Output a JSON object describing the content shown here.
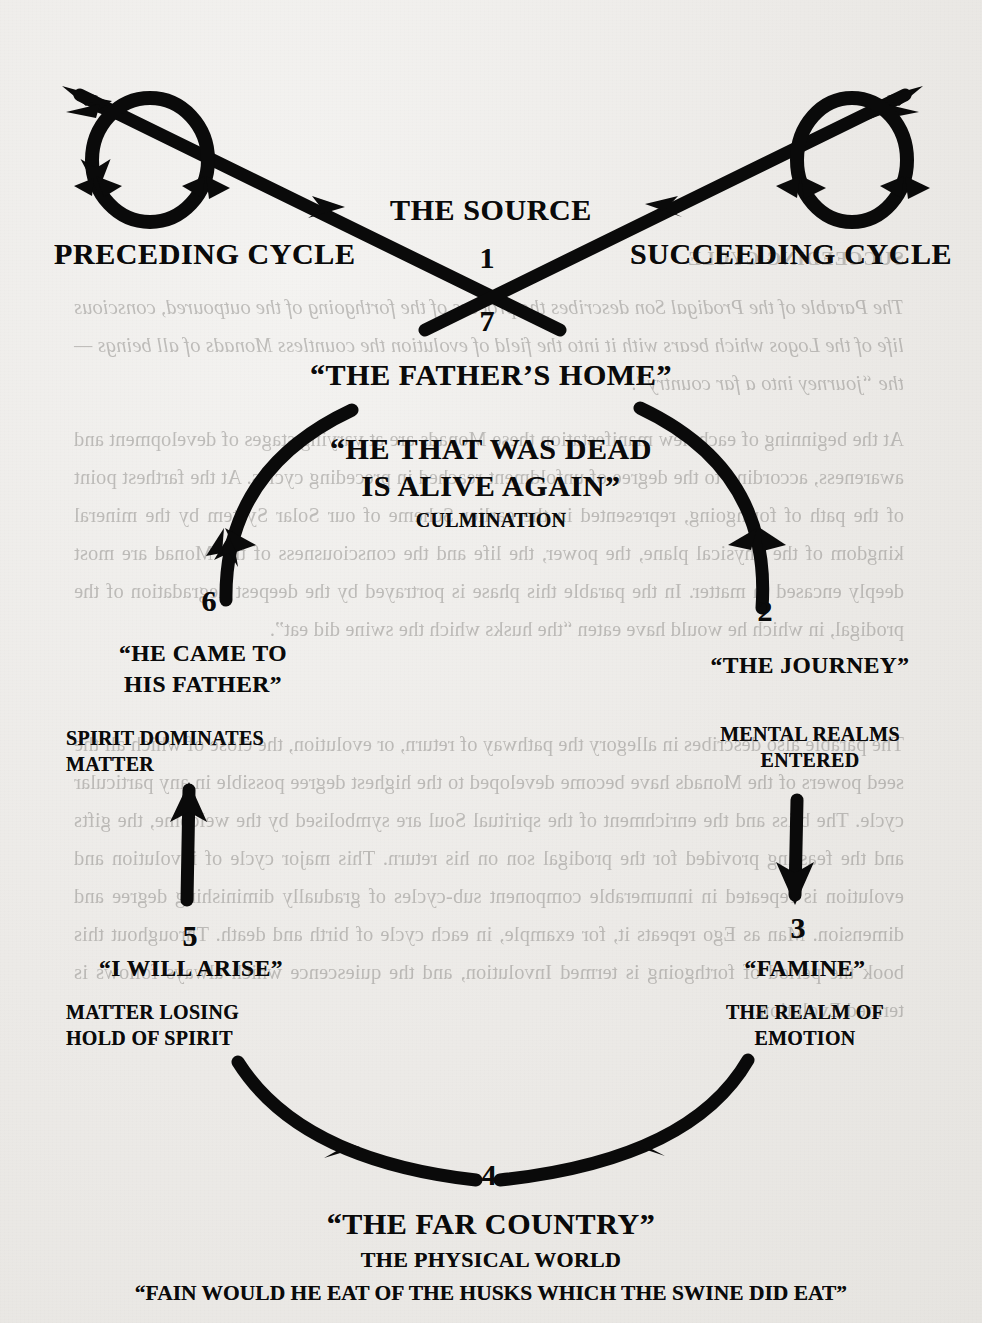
{
  "figure": {
    "type": "cycle-diagram",
    "title_center": "THE SOURCE",
    "paper_color": "#edecea",
    "ink_color": "#0a0a0a",
    "ghost_ink_color": "#8f8d8a"
  },
  "top": {
    "left_cycle_label": "PRECEDING CYCLE",
    "right_cycle_label": "SUCCEEDING CYCLE",
    "source_label": "THE SOURCE",
    "number_above_crossing": "1",
    "number_below_crossing": "7"
  },
  "stages": [
    {
      "number": "1",
      "name": "stage-1-the-source",
      "title": "THE SOURCE",
      "subtitle": "",
      "position": "top-center"
    },
    {
      "number": "7",
      "name": "stage-7-the-fathers-home",
      "title": "“THE FATHER’S HOME”",
      "subtitle": "",
      "position": "top-center-below"
    },
    {
      "number": "6",
      "name": "stage-6-he-came-to-his-father",
      "title_line_1": "“HE CAME TO",
      "title_line_2": "HIS FATHER”",
      "subtitle_line_1": "SPIRIT DOMINATES",
      "subtitle_line_2": "MATTER",
      "position": "left-upper"
    },
    {
      "number": "5",
      "name": "stage-5-i-will-arise",
      "title": "“I WILL ARISE”",
      "subtitle_line_1": "MATTER LOSING",
      "subtitle_line_2": "HOLD OF SPIRIT",
      "position": "left-lower"
    },
    {
      "number": "4",
      "name": "stage-4-the-far-country",
      "title": "“THE FAR COUNTRY”",
      "subtitle": "THE PHYSICAL WORLD",
      "quote": "“FAIN WOULD HE EAT OF THE HUSKS WHICH THE SWINE DID EAT”",
      "position": "bottom-center"
    },
    {
      "number": "3",
      "name": "stage-3-famine",
      "title": "“FAMINE”",
      "subtitle_line_1": "THE REALM OF",
      "subtitle_line_2": "EMOTION",
      "position": "right-lower"
    },
    {
      "number": "2",
      "name": "stage-2-the-journey",
      "title": "“THE JOURNEY”",
      "subtitle_line_1": "MENTAL REALMS",
      "subtitle_line_2": "ENTERED",
      "position": "right-upper"
    }
  ],
  "center": {
    "culmination_line_1": "“HE THAT WAS DEAD",
    "culmination_line_2": "IS ALIVE AGAIN”",
    "culmination_caption": "CULMINATION",
    "fathers_home": "“THE FATHER’S HOME”"
  },
  "ghost_text": {
    "note": "mirror-reversed bleed-through from the reverse side of the page",
    "heading": "SUCCEEDING CYCLE",
    "paragraphs": [
      "The Parable of the Prodigal Son describes the process of the forthgoing of the outpoured, conscious life of the Logos which bears with it into the field of evolution the countless Monads of all beings — the “journey into a far country”.",
      "At the beginning of each new manifestation these Monads are at varying stages of development and awareness, according to the degree of unfoldment reached in preceding cycles. At the farthest point of the path of forthgoing, represented in the earlier Scheme of our Solar System by the mineral kingdom of the physical plane, the power, the life and the consciousness of the Monad are most deeply encased in matter. In the parable this phase is portrayed by the deepest degradation of the prodigal, in which he would have eaten “the husks which the swine did eat”.",
      "The parable also describes in allegory the pathway of return, or evolution, the close of which all the seed powers of the Monads have become developed to the highest degree possible in any particular cycle. The bliss and the enrichment of the spiritual Soul are symbolised by the welcome, the gifts and the feasting provided for the prodigal son on his return. This major cycle of involution and evolution is repeated in innumerable component sub-cycles of gradually diminishing degree and dimension. Man as Ego repeats it, for example, in each cycle of birth and death. Throughout this book the period of forthgoing is termed Involution, and the quiescence which always follows is termed Evolution."
    ]
  }
}
